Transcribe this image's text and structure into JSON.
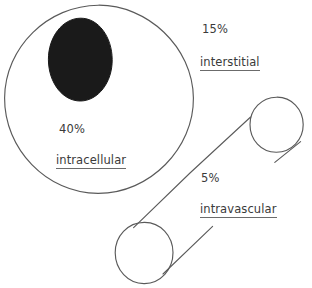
{
  "diagram": {
    "style": "hand-drawn line diagram",
    "background_color": "#ffffff",
    "stroke_color": "#5a5a5a",
    "nucleus_color": "#1a1a1a",
    "text_color": "#3a3a3a",
    "compartments": [
      {
        "id": "interstitial",
        "percent": "15%",
        "name": "interstitial",
        "underlined": true
      },
      {
        "id": "intracellular",
        "percent": "40%",
        "name": "intracellular",
        "underlined": true
      },
      {
        "id": "intravascular",
        "percent": "5%",
        "name": "intravascular",
        "underlined": true
      }
    ],
    "shapes": {
      "cell_outline": "large-circle",
      "nucleus": "filled-ellipse",
      "vessel_upper": "small-circle",
      "vessel_lower": "small-circle",
      "connector": "long-diagonal-line"
    }
  }
}
